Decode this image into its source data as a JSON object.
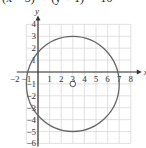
{
  "equation": "(x − 3)² + (y + 1)² = 16",
  "label": "•",
  "chart_data": {
    "type": "scatter",
    "title": "(x − 3)² + (y + 1)² = 16",
    "xlabel": "x",
    "ylabel": "y",
    "xlim": [
      -2,
      8
    ],
    "ylim": [
      -6,
      4
    ],
    "grid": true,
    "x_ticks": [
      "-2",
      "-1",
      "1",
      "2",
      "3",
      "4",
      "5",
      "6",
      "7",
      "8"
    ],
    "y_ticks": [
      "4",
      "3",
      "2",
      "1",
      "-1",
      "-2",
      "-3",
      "-4",
      "-5",
      "-6"
    ],
    "shapes": [
      {
        "kind": "circle",
        "center": [
          3,
          -1
        ],
        "radius": 4,
        "stroke": "#666666"
      }
    ],
    "points": [
      {
        "x": 3,
        "y": -1,
        "style": "open-circle",
        "label": "center"
      }
    ],
    "colors": {
      "grid": "#d9d9d9",
      "axis": "#333333",
      "curve": "#6e6e6e"
    }
  }
}
